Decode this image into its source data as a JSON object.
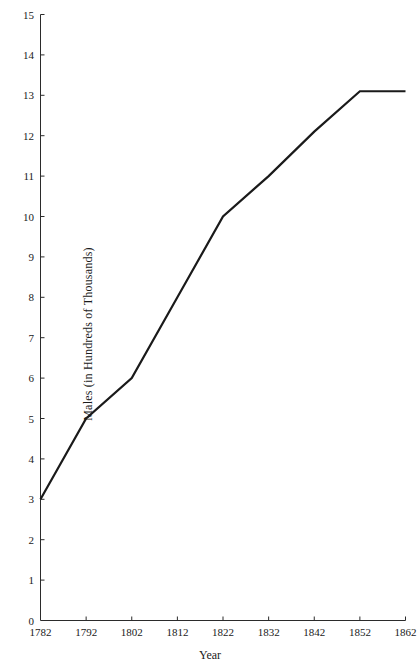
{
  "chart_data": {
    "type": "line",
    "title": "",
    "subtitle": "",
    "xlabel": "Year",
    "ylabel": "Males (in Hundreds of Thousands)",
    "x": [
      1782,
      1792,
      1802,
      1812,
      1822,
      1832,
      1842,
      1852,
      1862
    ],
    "values": [
      3,
      5,
      6,
      8,
      10,
      11,
      12.1,
      13.1,
      13.1
    ],
    "series": [
      {
        "name": "Males",
        "values": [
          3,
          5,
          6,
          8,
          10,
          11,
          12.1,
          13.1,
          13.1
        ]
      }
    ],
    "xlim": [
      1782,
      1862
    ],
    "ylim": [
      0,
      15
    ],
    "xticks": [
      1782,
      1792,
      1802,
      1812,
      1822,
      1832,
      1842,
      1852,
      1862
    ],
    "xtick_labels": [
      "1782",
      "1792",
      "1802",
      "1812",
      "1822",
      "1832",
      "1842",
      "1852",
      "1862"
    ],
    "yticks": [
      0,
      1,
      2,
      3,
      4,
      5,
      6,
      7,
      8,
      9,
      10,
      11,
      12,
      13,
      14,
      15
    ],
    "ytick_labels": [
      "0",
      "1",
      "2",
      "3",
      "4",
      "5",
      "6",
      "7",
      "8",
      "9",
      "10",
      "11",
      "12",
      "13",
      "14",
      "15"
    ],
    "grid": false,
    "legend": false,
    "legend_position": "none",
    "line_color": "#1a1a1a",
    "line_width": 2.2,
    "background_color": "#ffffff",
    "axis_color": "#2b2b2b",
    "annotations": []
  }
}
